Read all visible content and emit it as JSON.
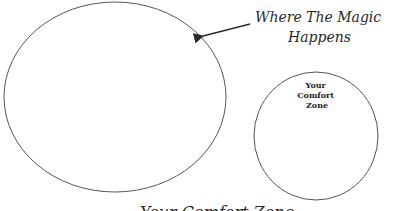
{
  "diagram": {
    "big_circle": {
      "label": "",
      "stroke": "#555555",
      "cx": 115,
      "cy": 97,
      "rx": 111,
      "ry": 95
    },
    "small_circle": {
      "label_lines": [
        "Your",
        "Comfort",
        "Zone"
      ],
      "stroke": "#555555",
      "cx": 316,
      "cy": 136,
      "rx": 62,
      "ry": 64
    },
    "annotation": {
      "lines": [
        "Where The Magic",
        "Happens"
      ],
      "arrow": {
        "x1": 250,
        "y1": 24,
        "x2": 201,
        "y2": 36
      },
      "color": "#2a2a2a"
    },
    "bottom_caption": {
      "text": "Your Comfort Zone",
      "note": "clipped at bottom edge"
    }
  }
}
